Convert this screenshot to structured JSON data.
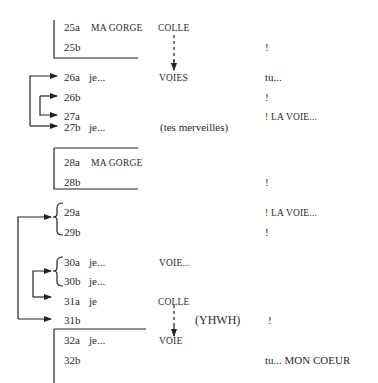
{
  "rows": [
    {
      "id": "25a",
      "col1": "MA GORGE",
      "col2": "COLLE",
      "col3": ""
    },
    {
      "id": "25b",
      "col1": "",
      "col2": "",
      "col3": "!"
    },
    {
      "id": "26a",
      "col1": "je...",
      "col2": "VOIES",
      "col3": "tu..."
    },
    {
      "id": "26b",
      "col1": "",
      "col2": "",
      "col3": "!"
    },
    {
      "id": "27a",
      "col1": "",
      "col2": "",
      "col3": "! LA VOIE..."
    },
    {
      "id": "27b",
      "col1": "je...",
      "col2": "(tes merveilles)",
      "col3": ""
    },
    {
      "id": "28a",
      "col1": "MA GORGE",
      "col2": "",
      "col3": ""
    },
    {
      "id": "28b",
      "col1": "",
      "col2": "",
      "col3": "!"
    },
    {
      "id": "29a",
      "col1": "",
      "col2": "",
      "col3": "! LA VOIE..."
    },
    {
      "id": "29b",
      "col1": "",
      "col2": "",
      "col3": "!"
    },
    {
      "id": "30a",
      "col1": "je...",
      "col2": "VOIE...",
      "col3": ""
    },
    {
      "id": "30b",
      "col1": "je...",
      "col2": "",
      "col3": ""
    },
    {
      "id": "31a",
      "col1": "je",
      "col2": "COLLE",
      "col3": ""
    },
    {
      "id": "31b",
      "col1": "",
      "col2": "(YHWH)",
      "col3": "!"
    },
    {
      "id": "32a",
      "col1": "je...",
      "col2": "VOIE",
      "col3": ""
    },
    {
      "id": "32b",
      "col1": "",
      "col2": "",
      "col3": "tu... MON COEUR"
    }
  ]
}
